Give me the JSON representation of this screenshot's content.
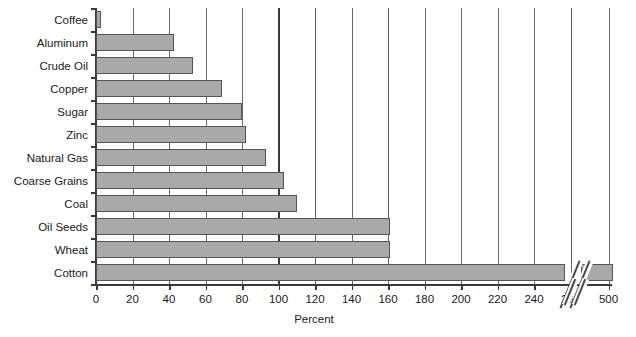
{
  "chart_data": {
    "type": "bar",
    "orientation": "horizontal",
    "title": "",
    "xlabel": "Percent",
    "ylabel": "",
    "categories": [
      "Coffee",
      "Aluminum",
      "Crude Oil",
      "Copper",
      "Sugar",
      "Zinc",
      "Natural Gas",
      "Coarse Grains",
      "Coal",
      "Oil Seeds",
      "Wheat",
      "Cotton"
    ],
    "values": [
      3,
      43,
      53,
      69,
      80,
      82,
      93,
      103,
      110,
      161,
      161,
      500
    ],
    "xlim": [
      0,
      500
    ],
    "xticks": [
      0,
      20,
      40,
      60,
      80,
      100,
      120,
      140,
      160,
      180,
      200,
      220,
      240,
      260,
      500
    ],
    "xtick_labels": [
      "0",
      "20",
      "40",
      "60",
      "80",
      "100",
      "120",
      "140",
      "160",
      "180",
      "200",
      "220",
      "240",
      "260",
      "500"
    ],
    "axis_break": {
      "present": true,
      "between": [
        260,
        500
      ],
      "style": "double-slash"
    },
    "grid": true,
    "grid_axis": "x",
    "emphasized_gridlines": [
      100
    ],
    "legend": null,
    "bar_color": "#a9a9a9",
    "bar_edge_color": "#555555",
    "gridline_color": "#6a6a6a",
    "axis_color": "#3a3a3a",
    "background": "#ffffff"
  }
}
